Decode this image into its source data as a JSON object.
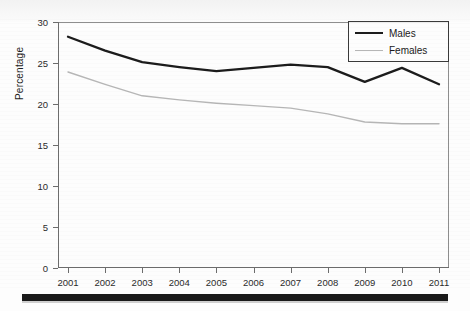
{
  "chart_data": {
    "type": "line",
    "title": "",
    "xlabel": "",
    "ylabel": "Percentage",
    "categories": [
      "2001",
      "2002",
      "2003",
      "2004",
      "2005",
      "2006",
      "2007",
      "2008",
      "2009",
      "2010",
      "2011"
    ],
    "x": [
      2001,
      2002,
      2003,
      2004,
      2005,
      2006,
      2007,
      2008,
      2009,
      2010,
      2011
    ],
    "ylim": [
      0,
      30
    ],
    "yticks": [
      0,
      5,
      10,
      15,
      20,
      25,
      30
    ],
    "ytick_labels": [
      "0",
      "5",
      "10",
      "15",
      "20",
      "25",
      "30"
    ],
    "grid": false,
    "legend_position": "top-right",
    "series": [
      {
        "name": "Males",
        "color": "#1c1c1c",
        "line_width": 2.3,
        "values": [
          28.2,
          26.5,
          25.1,
          24.5,
          24.0,
          24.4,
          24.8,
          24.5,
          22.7,
          24.4,
          22.4
        ]
      },
      {
        "name": "Females",
        "color": "#b6b6b6",
        "line_width": 1.4,
        "values": [
          23.9,
          22.4,
          21.0,
          20.5,
          20.1,
          19.8,
          19.5,
          18.8,
          17.8,
          17.6,
          17.6
        ]
      }
    ]
  },
  "legend": {
    "entries": [
      {
        "label": "Males"
      },
      {
        "label": "Females"
      }
    ]
  },
  "artifacts": {
    "ghost_line_1": "",
    "ghost_line_2": ""
  },
  "colors": {
    "males": "#1c1c1c",
    "females": "#b6b6b6",
    "axis": "#6d6d6d",
    "text": "#1e1e1e",
    "rule": "#1a1a1a"
  }
}
